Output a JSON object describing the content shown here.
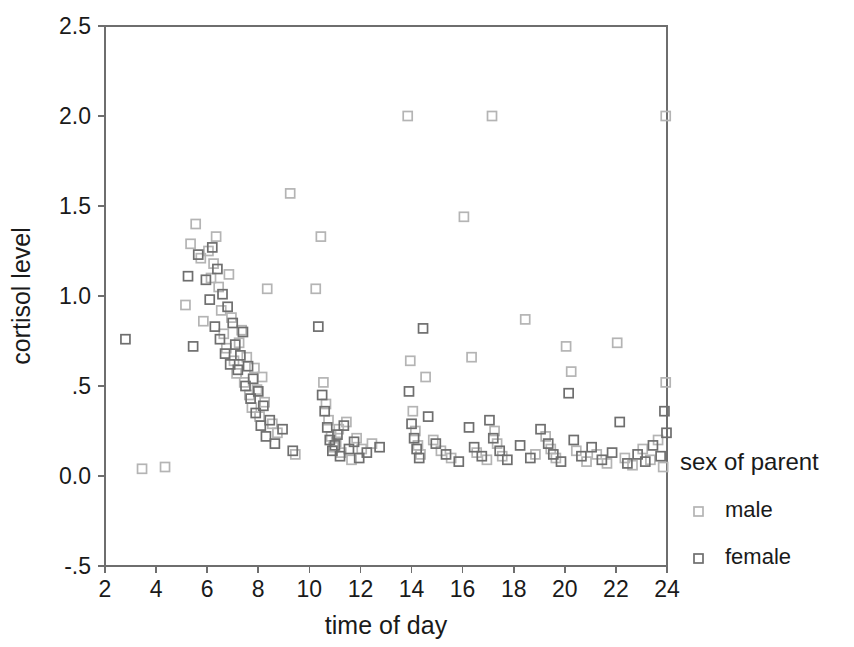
{
  "chart_data": {
    "type": "scatter",
    "title": "",
    "xlabel": "time of day",
    "ylabel": "cortisol level",
    "xlim": [
      2,
      24
    ],
    "ylim": [
      -0.5,
      2.5
    ],
    "xticks": [
      "2",
      "4",
      "6",
      "8",
      "10",
      "12",
      "14",
      "16",
      "18",
      "20",
      "22",
      "24"
    ],
    "xtick_values": [
      2,
      4,
      6,
      8,
      10,
      12,
      14,
      16,
      18,
      20,
      22,
      24
    ],
    "yticks": [
      "2.5",
      "2.0",
      "1.5",
      "1.0",
      ".5",
      "0.0",
      "-.5"
    ],
    "ytick_values": [
      2.5,
      2.0,
      1.5,
      1.0,
      0.5,
      0.0,
      -0.5
    ],
    "grid": false,
    "legend_position": "right",
    "legend_title": "sex of parent",
    "marker": "open-square",
    "series": [
      {
        "name": "male",
        "color": "#b4b4b4",
        "points": [
          [
            3.45,
            0.04
          ],
          [
            4.35,
            0.05
          ],
          [
            5.15,
            0.95
          ],
          [
            5.35,
            1.29
          ],
          [
            5.55,
            1.4
          ],
          [
            5.75,
            1.21
          ],
          [
            5.85,
            0.86
          ],
          [
            6.05,
            1.25
          ],
          [
            6.15,
            1.1
          ],
          [
            6.25,
            1.18
          ],
          [
            6.35,
            1.33
          ],
          [
            6.45,
            1.05
          ],
          [
            6.55,
            0.92
          ],
          [
            6.65,
            0.79
          ],
          [
            6.75,
            0.71
          ],
          [
            6.85,
            1.12
          ],
          [
            6.95,
            0.88
          ],
          [
            7.05,
            0.64
          ],
          [
            7.15,
            0.57
          ],
          [
            7.25,
            0.74
          ],
          [
            7.35,
            0.81
          ],
          [
            7.45,
            0.52
          ],
          [
            7.55,
            0.66
          ],
          [
            7.65,
            0.45
          ],
          [
            7.75,
            0.38
          ],
          [
            7.85,
            0.6
          ],
          [
            7.95,
            0.48
          ],
          [
            8.05,
            0.33
          ],
          [
            8.15,
            0.55
          ],
          [
            8.25,
            0.41
          ],
          [
            8.35,
            1.04
          ],
          [
            8.55,
            0.29
          ],
          [
            8.75,
            0.24
          ],
          [
            9.25,
            1.57
          ],
          [
            9.45,
            0.12
          ],
          [
            10.25,
            1.04
          ],
          [
            10.45,
            1.33
          ],
          [
            10.55,
            0.52
          ],
          [
            10.65,
            0.4
          ],
          [
            10.75,
            0.31
          ],
          [
            10.85,
            0.22
          ],
          [
            10.95,
            0.16
          ],
          [
            11.05,
            0.19
          ],
          [
            11.15,
            0.26
          ],
          [
            11.25,
            0.13
          ],
          [
            11.45,
            0.3
          ],
          [
            11.65,
            0.09
          ],
          [
            11.85,
            0.21
          ],
          [
            12.05,
            0.15
          ],
          [
            12.45,
            0.18
          ],
          [
            13.85,
            2.0
          ],
          [
            13.95,
            0.64
          ],
          [
            14.05,
            0.36
          ],
          [
            14.15,
            0.25
          ],
          [
            14.25,
            0.17
          ],
          [
            14.35,
            0.12
          ],
          [
            14.55,
            0.55
          ],
          [
            14.85,
            0.2
          ],
          [
            15.15,
            0.14
          ],
          [
            15.55,
            0.1
          ],
          [
            16.05,
            1.44
          ],
          [
            16.35,
            0.66
          ],
          [
            16.55,
            0.13
          ],
          [
            16.95,
            0.09
          ],
          [
            17.15,
            2.0
          ],
          [
            17.25,
            0.25
          ],
          [
            17.35,
            0.18
          ],
          [
            17.55,
            0.11
          ],
          [
            18.45,
            0.87
          ],
          [
            18.85,
            0.12
          ],
          [
            19.25,
            0.22
          ],
          [
            19.45,
            0.15
          ],
          [
            19.65,
            0.1
          ],
          [
            20.05,
            0.72
          ],
          [
            20.25,
            0.58
          ],
          [
            20.45,
            0.14
          ],
          [
            20.85,
            0.08
          ],
          [
            21.25,
            0.12
          ],
          [
            21.65,
            0.07
          ],
          [
            22.05,
            0.74
          ],
          [
            22.35,
            0.1
          ],
          [
            22.65,
            0.06
          ],
          [
            23.05,
            0.15
          ],
          [
            23.35,
            0.09
          ],
          [
            23.65,
            0.2
          ],
          [
            23.85,
            0.05
          ],
          [
            23.95,
            2.0
          ],
          [
            23.95,
            0.52
          ]
        ]
      },
      {
        "name": "female",
        "color": "#6e6e6e",
        "points": [
          [
            2.8,
            0.76
          ],
          [
            5.25,
            1.11
          ],
          [
            5.45,
            0.72
          ],
          [
            5.65,
            1.23
          ],
          [
            5.95,
            1.09
          ],
          [
            6.1,
            0.98
          ],
          [
            6.2,
            1.27
          ],
          [
            6.3,
            0.83
          ],
          [
            6.4,
            1.15
          ],
          [
            6.5,
            0.76
          ],
          [
            6.6,
            1.01
          ],
          [
            6.7,
            0.68
          ],
          [
            6.8,
            0.94
          ],
          [
            6.9,
            0.62
          ],
          [
            7.0,
            0.85
          ],
          [
            7.1,
            0.73
          ],
          [
            7.2,
            0.59
          ],
          [
            7.3,
            0.67
          ],
          [
            7.4,
            0.8
          ],
          [
            7.5,
            0.5
          ],
          [
            7.6,
            0.61
          ],
          [
            7.7,
            0.43
          ],
          [
            7.8,
            0.54
          ],
          [
            7.9,
            0.35
          ],
          [
            8.0,
            0.47
          ],
          [
            8.1,
            0.28
          ],
          [
            8.2,
            0.39
          ],
          [
            8.3,
            0.22
          ],
          [
            8.45,
            0.31
          ],
          [
            8.65,
            0.18
          ],
          [
            8.95,
            0.26
          ],
          [
            9.35,
            0.14
          ],
          [
            10.35,
            0.83
          ],
          [
            10.5,
            0.45
          ],
          [
            10.6,
            0.36
          ],
          [
            10.7,
            0.27
          ],
          [
            10.8,
            0.2
          ],
          [
            10.9,
            0.14
          ],
          [
            11.0,
            0.17
          ],
          [
            11.1,
            0.23
          ],
          [
            11.2,
            0.11
          ],
          [
            11.35,
            0.28
          ],
          [
            11.55,
            0.15
          ],
          [
            11.75,
            0.19
          ],
          [
            11.95,
            0.1
          ],
          [
            12.25,
            0.13
          ],
          [
            12.75,
            0.16
          ],
          [
            13.9,
            0.47
          ],
          [
            14.0,
            0.29
          ],
          [
            14.1,
            0.21
          ],
          [
            14.2,
            0.15
          ],
          [
            14.3,
            0.1
          ],
          [
            14.45,
            0.82
          ],
          [
            14.65,
            0.33
          ],
          [
            14.95,
            0.18
          ],
          [
            15.35,
            0.12
          ],
          [
            15.85,
            0.08
          ],
          [
            16.25,
            0.27
          ],
          [
            16.45,
            0.16
          ],
          [
            16.75,
            0.11
          ],
          [
            17.05,
            0.31
          ],
          [
            17.2,
            0.21
          ],
          [
            17.45,
            0.14
          ],
          [
            17.75,
            0.09
          ],
          [
            18.25,
            0.17
          ],
          [
            18.65,
            0.1
          ],
          [
            19.05,
            0.26
          ],
          [
            19.35,
            0.18
          ],
          [
            19.55,
            0.12
          ],
          [
            19.85,
            0.08
          ],
          [
            20.15,
            0.46
          ],
          [
            20.35,
            0.2
          ],
          [
            20.65,
            0.11
          ],
          [
            21.05,
            0.16
          ],
          [
            21.45,
            0.09
          ],
          [
            21.85,
            0.13
          ],
          [
            22.15,
            0.3
          ],
          [
            22.45,
            0.07
          ],
          [
            22.85,
            0.12
          ],
          [
            23.15,
            0.08
          ],
          [
            23.45,
            0.17
          ],
          [
            23.75,
            0.11
          ],
          [
            23.9,
            0.36
          ],
          [
            23.98,
            0.24
          ]
        ]
      }
    ]
  },
  "legend": {
    "title": "sex of parent",
    "items": [
      {
        "label": "male",
        "color": "#b4b4b4"
      },
      {
        "label": "female",
        "color": "#6e6e6e"
      }
    ]
  },
  "axes": {
    "x_title": "time of day",
    "y_title": "cortisol level"
  }
}
